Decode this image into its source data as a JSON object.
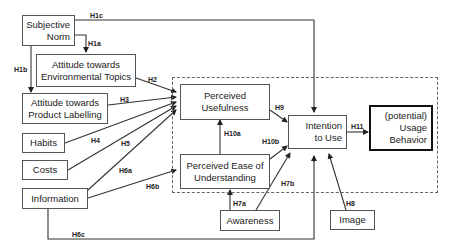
{
  "diagram": {
    "type": "research-model",
    "nodes": {
      "subjective_norm": {
        "line1": "Subjective",
        "line2": "Norm"
      },
      "attitude_env": {
        "line1": "Attitude towards",
        "line2": "Environmental Topics"
      },
      "attitude_label": {
        "line1": "Attitude towards",
        "line2": "Product Labelling"
      },
      "habits": {
        "line1": "Habits"
      },
      "costs": {
        "line1": "Costs"
      },
      "information": {
        "line1": "Information"
      },
      "perceived_usefulness": {
        "line1": "Perceived",
        "line2": "Usefulness"
      },
      "perceived_ease": {
        "line1": "Perceived Ease of",
        "line2": "Understanding"
      },
      "intention": {
        "line1": "Intention",
        "line2": "to Use"
      },
      "usage": {
        "line1": "(potential)",
        "line2": "Usage",
        "line3": "Behavior"
      },
      "awareness": {
        "line1": "Awareness"
      },
      "image": {
        "line1": "Image"
      }
    },
    "hypotheses": {
      "h1a": "H1a",
      "h1b": "H1b",
      "h1c": "H1c",
      "h2": "H2",
      "h3": "H3",
      "h4": "H4",
      "h5": "H5",
      "h6a": "H6a",
      "h6b": "H6b",
      "h6c": "H6c",
      "h7a": "H7a",
      "h7b": "H7b",
      "h8": "H8",
      "h9": "H9",
      "h10a": "H10a",
      "h10b": "H10b",
      "h11": "H11"
    },
    "edges": [
      {
        "from": "Subjective Norm",
        "to": "Attitude towards Environmental Topics",
        "label": "H1a"
      },
      {
        "from": "Subjective Norm",
        "to": "Attitude towards Product Labelling",
        "label": "H1b"
      },
      {
        "from": "Subjective Norm",
        "to": "Intention to Use",
        "label": "H1c"
      },
      {
        "from": "Attitude towards Environmental Topics",
        "to": "Perceived Usefulness",
        "label": "H2"
      },
      {
        "from": "Attitude towards Product Labelling",
        "to": "Perceived Usefulness",
        "label": "H3"
      },
      {
        "from": "Habits",
        "to": "Perceived Usefulness",
        "label": "H4"
      },
      {
        "from": "Costs",
        "to": "Perceived Usefulness",
        "label": "H5"
      },
      {
        "from": "Information",
        "to": "Perceived Usefulness",
        "label": "H6a"
      },
      {
        "from": "Information",
        "to": "Perceived Ease of Understanding",
        "label": "H6b"
      },
      {
        "from": "Information",
        "to": "Intention to Use",
        "label": "H6c"
      },
      {
        "from": "Awareness",
        "to": "Perceived Ease of Understanding",
        "label": "H7a"
      },
      {
        "from": "Awareness",
        "to": "Intention to Use",
        "label": "H7b"
      },
      {
        "from": "Image",
        "to": "Intention to Use",
        "label": "H8"
      },
      {
        "from": "Perceived Usefulness",
        "to": "Intention to Use",
        "label": "H9"
      },
      {
        "from": "Perceived Ease of Understanding",
        "to": "Perceived Usefulness",
        "label": "H10a"
      },
      {
        "from": "Perceived Ease of Understanding",
        "to": "Intention to Use",
        "label": "H10b"
      },
      {
        "from": "Intention to Use",
        "to": "(potential) Usage Behavior",
        "label": "H11"
      }
    ]
  }
}
